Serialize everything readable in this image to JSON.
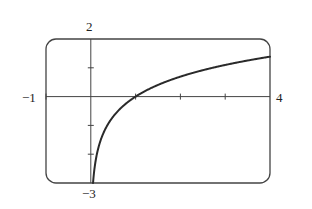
{
  "chart_data": {
    "type": "line",
    "title": "",
    "xlabel": "",
    "ylabel": "",
    "xlim": [
      -1,
      4
    ],
    "ylim": [
      -3,
      2
    ],
    "grid": false,
    "legend": null,
    "x_tick_step": 1,
    "y_tick_step": 1,
    "series": [
      {
        "name": "y = ln x",
        "x": [
          0.05,
          0.1,
          0.2,
          0.3,
          0.5,
          0.75,
          1,
          1.5,
          2,
          2.5,
          3,
          3.5,
          4
        ],
        "values": [
          -3.0,
          -2.3,
          -1.61,
          -1.2,
          -0.69,
          -0.29,
          0,
          0.41,
          0.69,
          0.92,
          1.1,
          1.25,
          1.39
        ]
      }
    ],
    "window_labels": {
      "xmin": "−1",
      "xmax": "4",
      "ymin": "−3",
      "ymax": "2"
    }
  },
  "colors": {
    "line": "#2a2a2a",
    "frame": "#444444",
    "background": "#ffffff"
  }
}
